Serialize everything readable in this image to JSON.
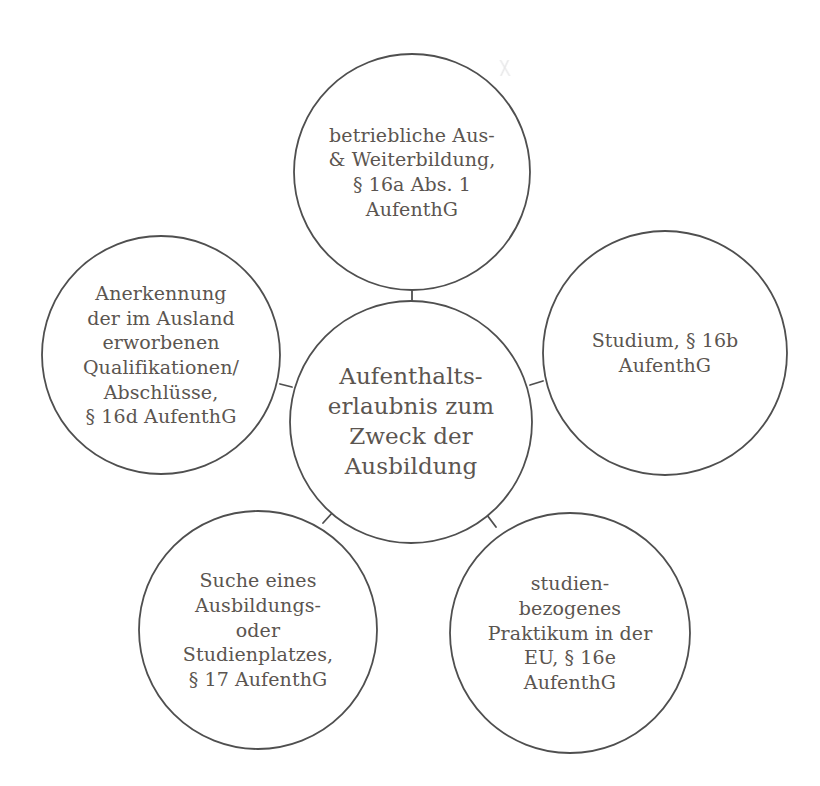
{
  "diagram": {
    "type": "hub-and-spoke",
    "title_node": {
      "id": "center",
      "label": "Aufenthalts-\nerlaubnis zum\nZweck der\nAusbildung",
      "cx": 411,
      "cy": 422,
      "r": 121
    },
    "nodes": [
      {
        "id": "betriebliche-ausbildung",
        "label": "betriebliche Aus-\n& Weiterbildung,\n§ 16a Abs. 1\nAufenthG",
        "paragraph": "§ 16a Abs. 1 AufenthG",
        "cx": 412,
        "cy": 172,
        "r": 118,
        "position": "top"
      },
      {
        "id": "anerkennung-qualifikationen",
        "label": "Anerkennung\nder im Ausland\nerworbenen\nQualifikationen/\nAbschlüsse,\n§ 16d AufenthG",
        "paragraph": "§ 16d AufenthG",
        "cx": 161,
        "cy": 355,
        "r": 119,
        "position": "left"
      },
      {
        "id": "studium",
        "label": "Studium, § 16b\nAufenthG",
        "paragraph": "§ 16b AufenthG",
        "cx": 665,
        "cy": 353,
        "r": 122,
        "position": "right"
      },
      {
        "id": "suche-ausbildungsplatz",
        "label": "Suche eines\nAusbildungs-\noder\nStudienplatzes,\n§ 17 AufenthG",
        "paragraph": "§ 17 AufenthG",
        "cx": 258,
        "cy": 630,
        "r": 119,
        "position": "bottom-left"
      },
      {
        "id": "studienbezogenes-praktikum",
        "label": "studien-\nbezogenes\nPraktikum in der\nEU, § 16e\nAufenthG",
        "paragraph": "§ 16e AufenthG",
        "cx": 570,
        "cy": 633,
        "r": 120,
        "position": "bottom-right"
      }
    ],
    "connectors": [
      {
        "id": "center-to-top",
        "x1": 412,
        "y1": 301,
        "x2": 412,
        "y2": 290
      },
      {
        "id": "center-to-left",
        "x1": 292,
        "y1": 387,
        "x2": 280,
        "y2": 384
      },
      {
        "id": "center-to-right",
        "x1": 530,
        "y1": 385,
        "x2": 543,
        "y2": 381
      },
      {
        "id": "center-to-bottom-left",
        "x1": 333,
        "y1": 512,
        "x2": 323,
        "y2": 523
      },
      {
        "id": "center-to-bottom-right",
        "x1": 487,
        "y1": 515,
        "x2": 496,
        "y2": 527
      }
    ],
    "style": {
      "stroke_color": "#4f4f4f",
      "text_color": "#5b5550",
      "fill_color": "#ffffff",
      "background": "#ffffff"
    }
  }
}
